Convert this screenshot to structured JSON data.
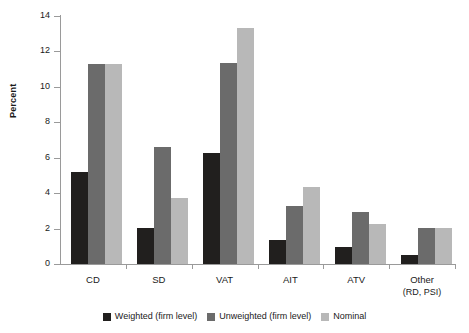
{
  "chart_data": {
    "type": "bar",
    "title": "",
    "xlabel": "",
    "ylabel": "Percent",
    "ylim": [
      0,
      14
    ],
    "yticks": [
      0,
      2,
      4,
      6,
      8,
      10,
      12,
      14
    ],
    "grid": false,
    "legend_position": "bottom",
    "categories": [
      "CD",
      "SD",
      "VAT",
      "AIT",
      "ATV",
      "Other"
    ],
    "category_sublabels": [
      "",
      "",
      "",
      "",
      "",
      "(RD, PSI)"
    ],
    "series": [
      {
        "name": "Weighted (firm level)",
        "color": "#211f1e",
        "values": [
          5.2,
          2.05,
          6.25,
          1.35,
          0.95,
          0.5
        ]
      },
      {
        "name": "Unweighted (firm level)",
        "color": "#6b6b6b",
        "values": [
          11.3,
          6.6,
          11.35,
          3.25,
          2.95,
          2.05
        ]
      },
      {
        "name": "Nominal",
        "color": "#b8b8b8",
        "values": [
          11.3,
          3.75,
          13.3,
          4.35,
          2.25,
          2.05
        ]
      }
    ]
  },
  "axis": {
    "y_label": "Percent",
    "y_tick_labels": [
      "0",
      "2",
      "4",
      "6",
      "8",
      "10",
      "12",
      "14"
    ]
  },
  "legend": {
    "items": [
      {
        "label": "Weighted (firm level)"
      },
      {
        "label": "Unweighted (firm level)"
      },
      {
        "label": "Nominal"
      }
    ]
  }
}
